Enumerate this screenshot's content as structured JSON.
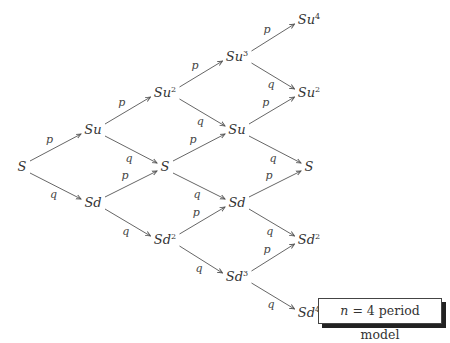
{
  "diagram": {
    "caption": {
      "var": "n",
      "eq": " = 4 period model"
    },
    "edge_labels": {
      "up": "p",
      "down": "q"
    },
    "nodes": [
      {
        "id": "n0",
        "base": "S",
        "exp": "",
        "x": 22,
        "y": 167
      },
      {
        "id": "n1u",
        "base": "Su",
        "exp": "",
        "x": 93,
        "y": 130
      },
      {
        "id": "n1d",
        "base": "Sd",
        "exp": "",
        "x": 93,
        "y": 203
      },
      {
        "id": "n2u",
        "base": "Su",
        "exp": "2",
        "x": 165,
        "y": 93
      },
      {
        "id": "n2m",
        "base": "S",
        "exp": "",
        "x": 165,
        "y": 167
      },
      {
        "id": "n2d",
        "base": "Sd",
        "exp": "2",
        "x": 165,
        "y": 240
      },
      {
        "id": "n3u",
        "base": "Su",
        "exp": "3",
        "x": 237,
        "y": 57
      },
      {
        "id": "n3mu",
        "base": "Su",
        "exp": "",
        "x": 237,
        "y": 130
      },
      {
        "id": "n3md",
        "base": "Sd",
        "exp": "",
        "x": 237,
        "y": 203
      },
      {
        "id": "n3d",
        "base": "Sd",
        "exp": "3",
        "x": 237,
        "y": 277
      },
      {
        "id": "n4a",
        "base": "Su",
        "exp": "4",
        "x": 309,
        "y": 20
      },
      {
        "id": "n4b",
        "base": "Su",
        "exp": "2",
        "x": 309,
        "y": 93
      },
      {
        "id": "n4c",
        "base": "S",
        "exp": "",
        "x": 309,
        "y": 167
      },
      {
        "id": "n4d",
        "base": "Sd",
        "exp": "2",
        "x": 309,
        "y": 240
      },
      {
        "id": "n4e",
        "base": "Sd",
        "exp": "4",
        "x": 309,
        "y": 313
      }
    ]
  }
}
